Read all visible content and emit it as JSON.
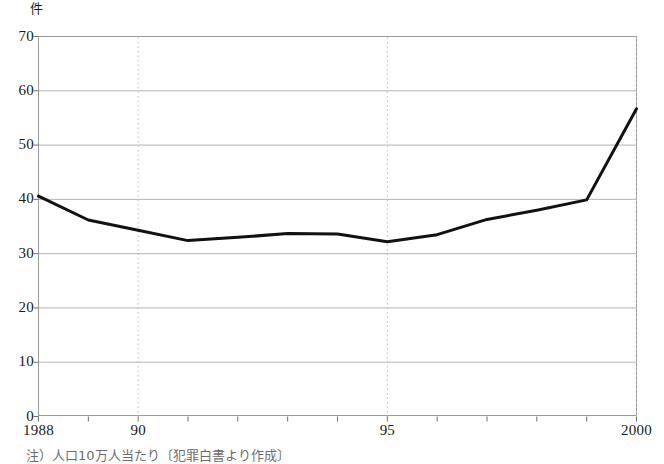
{
  "chart_data": {
    "type": "line",
    "title": "",
    "subtitle": "",
    "xlabel": "",
    "ylabel": "件",
    "y_unit_label": "件",
    "x": [
      1988,
      1989,
      1990,
      1991,
      1992,
      1993,
      1994,
      1995,
      1996,
      1997,
      1998,
      1999,
      2000
    ],
    "values": [
      40.6,
      36.2,
      34.3,
      32.4,
      33.0,
      33.7,
      33.6,
      32.2,
      33.5,
      36.3,
      38.0,
      39.9,
      56.7
    ],
    "series": [
      {
        "name": "",
        "values": [
          40.6,
          36.2,
          34.3,
          32.4,
          33.0,
          33.7,
          33.6,
          32.2,
          33.5,
          36.3,
          38.0,
          39.9,
          56.7
        ]
      }
    ],
    "xlim": [
      1988,
      2000
    ],
    "ylim": [
      0,
      70
    ],
    "y_ticks": [
      0,
      10,
      20,
      30,
      40,
      50,
      60,
      70
    ],
    "y_tick_labels": [
      "0",
      "10",
      "20",
      "30",
      "40",
      "50",
      "60",
      "70"
    ],
    "x_ticks": [
      1988,
      1989,
      1990,
      1991,
      1992,
      1993,
      1994,
      1995,
      1996,
      1997,
      1998,
      1999,
      2000
    ],
    "x_tick_labels": [
      {
        "value": 1988,
        "label": "1988"
      },
      {
        "value": 1990,
        "label": "90"
      },
      {
        "value": 1995,
        "label": "95"
      },
      {
        "value": 2000,
        "label": "2000"
      }
    ],
    "vertical_gridlines": [
      1990,
      1995,
      2000
    ],
    "grid": true,
    "grid_horizontal": true,
    "grid_vertical_dotted": true,
    "legend": null,
    "legend_position": "none",
    "line_color": "#111111",
    "grid_color": "#b4b4b4",
    "dotted_grid_color": "#bdbdbd",
    "frame_color": "#9a9a9a",
    "background_color": "#ffffff",
    "line_width": 3.0,
    "annotations": []
  },
  "footnote": {
    "text": "注）人口10万人当たり〔犯罪白書より作成〕"
  }
}
